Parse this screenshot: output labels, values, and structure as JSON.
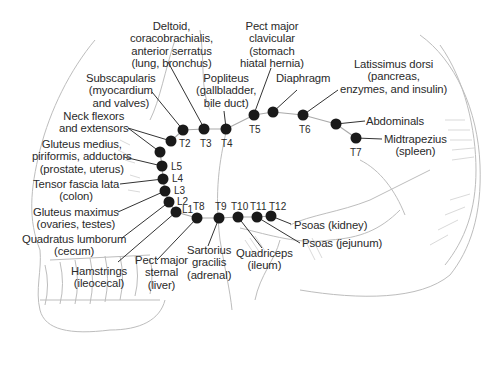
{
  "diagram": {
    "colors": {
      "dot": "#1a1a1a",
      "leader": "#333333",
      "skull": "#bdbdbd",
      "text": "#2a2a2a"
    },
    "labels": [
      {
        "id": "deltoid",
        "lines": [
          "Deltoid,",
          "coracobrachialis,",
          "anterior serratus",
          "(lung, bronchus)"
        ]
      },
      {
        "id": "pect-major-clavicular",
        "lines": [
          "Pect major",
          "clavicular",
          "(stomach",
          "hiatal hernia)"
        ]
      },
      {
        "id": "subscapularis",
        "lines": [
          "Subscapularis",
          "(myocardium",
          "and valves)"
        ]
      },
      {
        "id": "popliteus",
        "lines": [
          "Popliteus",
          "(gallbladder,",
          "bile duct)"
        ]
      },
      {
        "id": "diaphragm",
        "lines": [
          "Diaphragm"
        ]
      },
      {
        "id": "latissimus-dorsi",
        "lines": [
          "Latissimus dorsi",
          "(pancreas,",
          "enzymes, and insulin)"
        ]
      },
      {
        "id": "neck-flexors",
        "lines": [
          "Neck flexors",
          "and extensors"
        ]
      },
      {
        "id": "abdominals",
        "lines": [
          "Abdominals"
        ]
      },
      {
        "id": "midtrapezius",
        "lines": [
          "Midtrapezius",
          "(spleen)"
        ]
      },
      {
        "id": "gluteus-medius",
        "lines": [
          "Gluteus medius,",
          "piriformis, adductors",
          "(prostate, uterus)"
        ]
      },
      {
        "id": "tensor-fascia-lata",
        "lines": [
          "Tensor fascia lata",
          "(colon)"
        ]
      },
      {
        "id": "gluteus-maximus",
        "lines": [
          "Gluteus maximus",
          "(ovaries, testes)"
        ]
      },
      {
        "id": "quadratus-lumborum",
        "lines": [
          "Quadratus lumborum",
          "(cecum)"
        ]
      },
      {
        "id": "hamstrings",
        "lines": [
          "Hamstrings",
          "(ileocecal)"
        ]
      },
      {
        "id": "pect-major-sternal",
        "lines": [
          "Pect major",
          "sternal",
          "(liver)"
        ]
      },
      {
        "id": "sartorius",
        "lines": [
          "Sartorius",
          "gracilis",
          "(adrenal)"
        ]
      },
      {
        "id": "quadriceps",
        "lines": [
          "Quadriceps",
          "(ileum)"
        ]
      },
      {
        "id": "psoas-kidney",
        "lines": [
          "Psoas (kidney)"
        ]
      },
      {
        "id": "psoas-jejunum",
        "lines": [
          "Psoas (jejunum)"
        ]
      }
    ],
    "levels": [
      "T2",
      "T3",
      "T4",
      "T5",
      "T6",
      "T7",
      "L5",
      "L4",
      "L3",
      "L2",
      "L1",
      "T8",
      "T9",
      "T10",
      "T11",
      "T12"
    ]
  }
}
